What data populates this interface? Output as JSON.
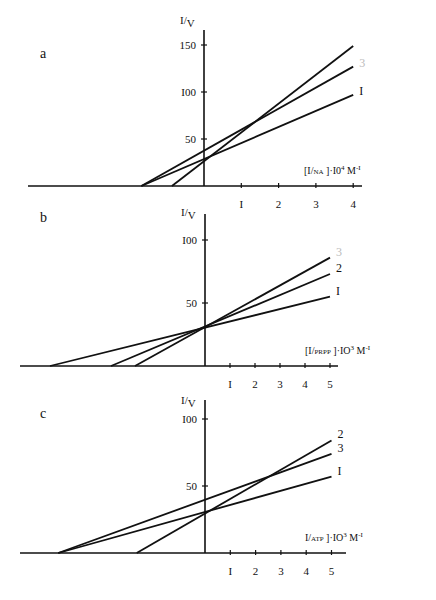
{
  "chart_data": [
    {
      "type": "line",
      "panel": "a",
      "title": "",
      "ylabel": "I/V",
      "xlabel": "[I/NA]·I0⁴ M⁻ᴵ",
      "xlabel_parts": {
        "pre": "[I/",
        "small": "NA",
        "post": "]·I0",
        "sup": "4",
        "tail": " M",
        "tail_sup": "-I"
      },
      "x_ticks": [
        {
          "v": 1,
          "label": "I"
        },
        {
          "v": 2,
          "label": "2"
        },
        {
          "v": 3,
          "label": "3"
        },
        {
          "v": 4,
          "label": "4"
        }
      ],
      "y_ticks": [
        {
          "v": 50,
          "label": "50"
        },
        {
          "v": 100,
          "label": "I00"
        },
        {
          "v": 150,
          "label": "150"
        }
      ],
      "xlim": [
        -5.4,
        4.2
      ],
      "ylim": [
        0,
        160
      ],
      "grid": false,
      "series": [
        {
          "name": "1",
          "label": "I",
          "faint": false,
          "x": [
            -1.68,
            4.0
          ],
          "y": [
            0,
            97
          ]
        },
        {
          "name": "2",
          "label": "",
          "faint": true,
          "x": [
            -0.86,
            4.0
          ],
          "y": [
            0,
            149
          ]
        },
        {
          "name": "3",
          "label": "3",
          "faint": true,
          "x": [
            -1.68,
            4.0
          ],
          "y": [
            0,
            127
          ]
        }
      ],
      "layout": {
        "ox": 204,
        "oy": 186,
        "px_per_x": 37.3,
        "px_per_y": 0.94,
        "x_left": 28,
        "x_right": 362,
        "y_top": 30,
        "letter_x": 40,
        "letter_y": 58,
        "ylabel_y": 24
      }
    },
    {
      "type": "line",
      "panel": "b",
      "title": "",
      "ylabel": "I/V",
      "xlabel": "[I/PRPP]·IO³ M⁻ᴵ",
      "xlabel_parts": {
        "pre": "[I/",
        "small": "PRPP",
        "post": "]·IO",
        "sup": "3",
        "tail": " M",
        "tail_sup": "-I"
      },
      "x_ticks": [
        {
          "v": 1,
          "label": "I"
        },
        {
          "v": 2,
          "label": "2"
        },
        {
          "v": 3,
          "label": "3"
        },
        {
          "v": 4,
          "label": "4"
        },
        {
          "v": 5,
          "label": "5"
        }
      ],
      "y_ticks": [
        {
          "v": 50,
          "label": "50"
        },
        {
          "v": 100,
          "label": "I00"
        }
      ],
      "xlim": [
        -7,
        5.5
      ],
      "ylim": [
        0,
        110
      ],
      "grid": false,
      "series": [
        {
          "name": "1",
          "label": "I",
          "faint": false,
          "x": [
            -6.2,
            5.0
          ],
          "y": [
            0,
            55
          ]
        },
        {
          "name": "2",
          "label": "2",
          "faint": false,
          "x": [
            -3.76,
            5.0
          ],
          "y": [
            0,
            73
          ]
        },
        {
          "name": "3",
          "label": "3",
          "faint": true,
          "x": [
            -2.8,
            5.0
          ],
          "y": [
            0,
            86
          ]
        }
      ],
      "layout": {
        "ox": 205,
        "oy": 366,
        "px_per_x": 25.0,
        "px_per_y": 1.26,
        "x_left": 20,
        "x_right": 338,
        "y_top": 214,
        "letter_x": 40,
        "letter_y": 222,
        "ylabel_y": 216
      }
    },
    {
      "type": "line",
      "panel": "c",
      "title": "",
      "ylabel": "I/V",
      "xlabel": "I/ATP]·IO³ M⁻ᴵ",
      "xlabel_parts": {
        "pre": "I/",
        "small": "ATP",
        "post": "]·IO",
        "sup": "3",
        "tail": " M",
        "tail_sup": "-I"
      },
      "x_ticks": [
        {
          "v": 1,
          "label": "I"
        },
        {
          "v": 2,
          "label": "2"
        },
        {
          "v": 3,
          "label": "3"
        },
        {
          "v": 4,
          "label": "4"
        },
        {
          "v": 5,
          "label": "5"
        }
      ],
      "y_ticks": [
        {
          "v": 50,
          "label": "50"
        },
        {
          "v": 100,
          "label": "I00"
        }
      ],
      "xlim": [
        -7,
        5.5
      ],
      "ylim": [
        0,
        110
      ],
      "grid": false,
      "series": [
        {
          "name": "1",
          "label": "I",
          "faint": false,
          "x": [
            -5.8,
            5.0
          ],
          "y": [
            0,
            57
          ]
        },
        {
          "name": "2",
          "label": "2",
          "faint": false,
          "x": [
            -2.7,
            5.0
          ],
          "y": [
            0,
            84
          ]
        },
        {
          "name": "3",
          "label": "3",
          "faint": false,
          "x": [
            -5.8,
            5.0
          ],
          "y": [
            0,
            74
          ]
        }
      ],
      "layout": {
        "ox": 205,
        "oy": 553,
        "px_per_x": 25.3,
        "px_per_y": 1.34,
        "x_left": 20,
        "x_right": 346,
        "y_top": 400,
        "letter_x": 40,
        "letter_y": 418,
        "ylabel_y": 404
      }
    }
  ]
}
